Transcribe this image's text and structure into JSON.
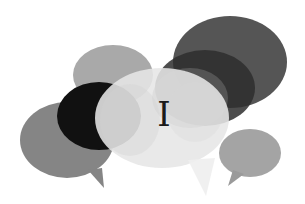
{
  "illustration": {
    "subject": "overlapping speech bubbles",
    "center_letter": "I",
    "colors": {
      "background": "#ffffff",
      "top_right_bubble": "#555555",
      "mid_dark_bubble": "#2e2e2e",
      "top_left_bubble": "#a9a9a9",
      "black_bubble": "#111111",
      "left_bubble": "#858585",
      "center_bubble": "#e6e6e6",
      "right_small_bubble": "#9a9a9a",
      "letter": "#1a1a1a"
    }
  }
}
